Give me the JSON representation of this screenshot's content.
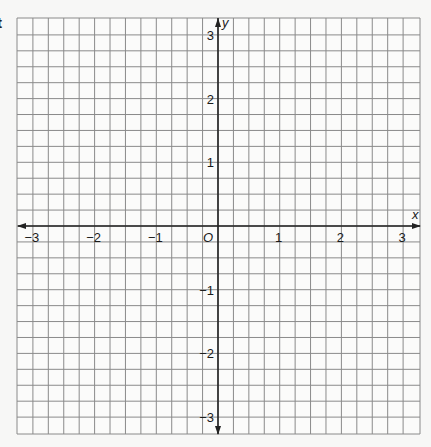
{
  "fragment_text": "t",
  "grid": {
    "left": 17,
    "right": 420,
    "top": 18,
    "bottom": 434,
    "origin_x": 218,
    "origin_y": 226,
    "unit_px_x": 61.7,
    "unit_px_y": 63.7,
    "subdivisions_per_unit": 4,
    "grid_color": "#8a8a8a",
    "axis_color": "#222222",
    "background": "#fbfbfa"
  },
  "axes": {
    "x_label": "x",
    "y_label": "y",
    "origin_label": "O",
    "x_ticks": [
      {
        "value": -3,
        "label": "−3"
      },
      {
        "value": -2,
        "label": "−2"
      },
      {
        "value": -1,
        "label": "−1"
      },
      {
        "value": 1,
        "label": "1"
      },
      {
        "value": 2,
        "label": "2"
      },
      {
        "value": 3,
        "label": "3"
      }
    ],
    "y_ticks": [
      {
        "value": 3,
        "label": "3"
      },
      {
        "value": 2,
        "label": "2"
      },
      {
        "value": 1,
        "label": "1"
      },
      {
        "value": -1,
        "label": "−1"
      },
      {
        "value": -2,
        "label": "−2"
      },
      {
        "value": -3,
        "label": "−3"
      }
    ],
    "x_range": [
      -3.25,
      3.25
    ],
    "y_range": [
      -3.25,
      3.25
    ]
  }
}
